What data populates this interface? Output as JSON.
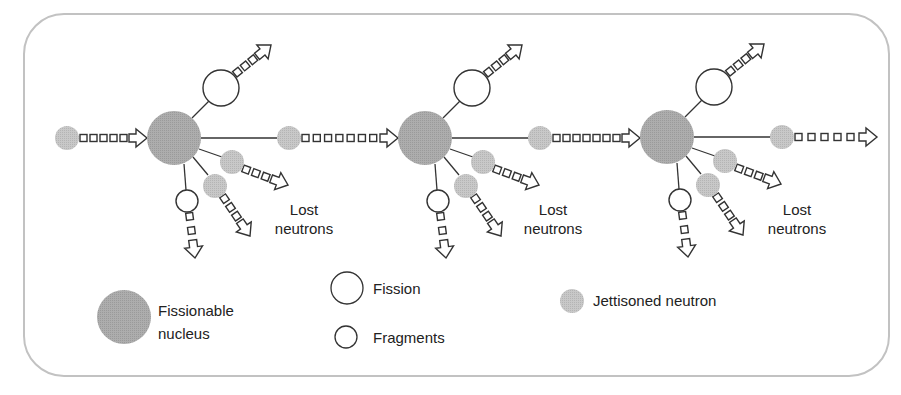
{
  "colors": {
    "nucleus": "#a8a8a8",
    "neutron": "#c4c4c4",
    "stroke": "#333333",
    "frame": "#bdbdbd",
    "text": "#222222"
  },
  "clusters": [
    {
      "cx": 174,
      "cy": 138,
      "lost_label_line1": "Lost",
      "lost_label_line2": "neutrons",
      "label_x": 304,
      "label_y": 200,
      "next_arrow_boxes": 7
    },
    {
      "cx": 425,
      "cy": 138,
      "lost_label_line1": "Lost",
      "lost_label_line2": "neutrons",
      "label_x": 553,
      "label_y": 200,
      "next_arrow_boxes": 7
    },
    {
      "cx": 667,
      "cy": 137,
      "lost_label_line1": "Lost",
      "lost_label_line2": "neutrons",
      "label_x": 797,
      "label_y": 200,
      "next_arrow_boxes": 5
    }
  ],
  "incoming_neutron": {
    "cx": 67,
    "cy": 138,
    "boxes": 5
  },
  "legend": {
    "nucleus": {
      "line1": "Fissionable",
      "line2": "nucleus"
    },
    "fission": "Fission",
    "fragments": "Fragments",
    "neutron": "Jettisoned neutron"
  }
}
